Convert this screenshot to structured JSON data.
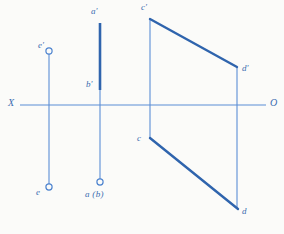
{
  "figure": {
    "background_color": "#fbfbf9",
    "stroke_color_thin": "#5b8ed6",
    "stroke_color_thick": "#2f64ad",
    "label_color": "#3a6cb0",
    "axis": {
      "label_left": "X",
      "label_right": "O",
      "y": 105,
      "x_start": 20,
      "x_end": 266
    },
    "labels": [
      {
        "id": "a-prime",
        "text": "a'",
        "x": 91,
        "y": 7
      },
      {
        "id": "b-prime",
        "text": "b'",
        "x": 86,
        "y": 80
      },
      {
        "id": "a-b-bottom",
        "text": "a (b)",
        "x": 85,
        "y": 190
      },
      {
        "id": "e-prime",
        "text": "e'",
        "x": 38,
        "y": 41
      },
      {
        "id": "e-bottom",
        "text": "e",
        "x": 36,
        "y": 188
      },
      {
        "id": "c-prime",
        "text": "c'",
        "x": 141,
        "y": 3
      },
      {
        "id": "d-prime",
        "text": "d'",
        "x": 242,
        "y": 64
      },
      {
        "id": "c-bottom",
        "text": "c",
        "x": 137,
        "y": 134
      },
      {
        "id": "d-bottom",
        "text": "d",
        "x": 242,
        "y": 207
      }
    ],
    "points": [
      {
        "id": "e-prime-marker",
        "x": 49,
        "y": 51,
        "r": 3.2,
        "filled": false
      },
      {
        "id": "e-marker",
        "x": 49,
        "y": 187,
        "r": 3.2,
        "filled": false
      },
      {
        "id": "a-b-marker",
        "x": 100,
        "y": 182,
        "r": 3.2,
        "filled": false
      }
    ],
    "segments": [
      {
        "id": "axis-XO",
        "x1": 20,
        "y1": 105,
        "x2": 266,
        "y2": 105,
        "weight": "thin"
      },
      {
        "id": "e-vertical-connector",
        "x1": 49,
        "y1": 54,
        "x2": 49,
        "y2": 184,
        "weight": "thin"
      },
      {
        "id": "ab-vertical-connector",
        "x1": 100,
        "y1": 90,
        "x2": 100,
        "y2": 179,
        "weight": "thin"
      },
      {
        "id": "ab-prime-segment",
        "x1": 100,
        "y1": 23,
        "x2": 100,
        "y2": 90,
        "weight": "thick"
      },
      {
        "id": "c-vertical-connector",
        "x1": 150,
        "y1": 19,
        "x2": 150,
        "y2": 138,
        "weight": "thin"
      },
      {
        "id": "d-vertical-connector",
        "x1": 237,
        "y1": 67,
        "x2": 237,
        "y2": 209,
        "weight": "thin"
      },
      {
        "id": "cd-prime-segment",
        "x1": 150,
        "y1": 19,
        "x2": 237,
        "y2": 67,
        "weight": "thick"
      },
      {
        "id": "cd-segment",
        "x1": 150,
        "y1": 138,
        "x2": 238,
        "y2": 209,
        "weight": "thick"
      }
    ]
  }
}
